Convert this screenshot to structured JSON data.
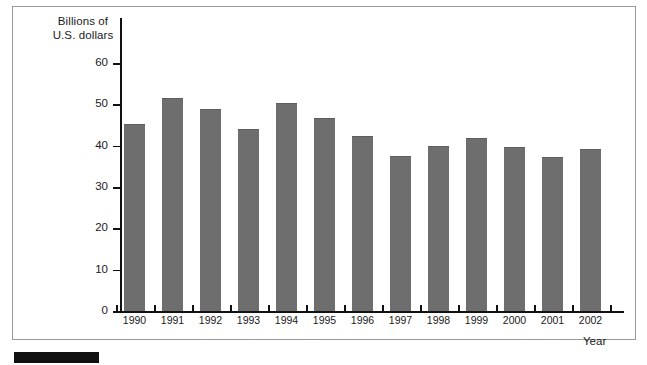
{
  "chart_data": {
    "type": "bar",
    "title": "",
    "subtitle": "",
    "xlabel": "Year",
    "ylabel": "Billions of U.S. dollars",
    "ylabel_lines": [
      "Billions of",
      "U.S. dollars"
    ],
    "categories": [
      "1990",
      "1991",
      "1992",
      "1993",
      "1994",
      "1995",
      "1996",
      "1997",
      "1998",
      "1999",
      "2000",
      "2001",
      "2002"
    ],
    "values": [
      45.2,
      51.5,
      48.9,
      44.1,
      50.4,
      46.7,
      42.4,
      37.4,
      39.9,
      41.9,
      39.7,
      37.2,
      39.1
    ],
    "ylim": [
      0,
      63
    ],
    "yticks": [
      0,
      10,
      20,
      30,
      40,
      50,
      60
    ],
    "ytick_labels": [
      "0",
      "10",
      "20",
      "30",
      "40",
      "50",
      "60"
    ],
    "grid": false,
    "legend": false,
    "legend_position": "none",
    "bar_color": "#6e6e6e",
    "axis_color": "#111111",
    "frame_color": "#9a9a9a",
    "background": "#ffffff"
  }
}
